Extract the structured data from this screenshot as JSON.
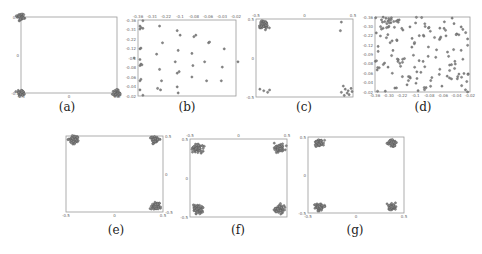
{
  "chart_data": [
    {
      "id": "a",
      "type": "scatter",
      "caption": "(a)",
      "frame": {
        "x": 21,
        "y": 17,
        "w": 96,
        "h": 76
      },
      "xticks": [
        "-0.5",
        "0",
        "0.5"
      ],
      "yticks": [
        "0.5",
        "0",
        "-0.5"
      ],
      "xtick_side": "bottom",
      "ytick_side": "left",
      "xlim": [
        -0.5,
        0.5
      ],
      "ylim": [
        -0.5,
        0.5
      ],
      "clusters": [
        {
          "cx": -0.5,
          "cy": 0.5,
          "n": 40,
          "spread": 0.06
        },
        {
          "cx": -0.5,
          "cy": -0.5,
          "n": 40,
          "spread": 0.06
        },
        {
          "cx": 0.5,
          "cy": -0.5,
          "n": 40,
          "spread": 0.06
        }
      ]
    },
    {
      "id": "b",
      "type": "scatter",
      "caption": "(b)",
      "frame": {
        "x": 138,
        "y": 20,
        "w": 98,
        "h": 76
      },
      "xticks": [
        "-0.36",
        "-0.31",
        "-0.22",
        "-0.1",
        "-0.08",
        "-0.06",
        "-0.03",
        "-0.02"
      ],
      "yticks": [
        "-0.36",
        "-0.31",
        "-0.22",
        "-0.12",
        "-0.1",
        "-0.08",
        "-0.06",
        "-0.04",
        "-0.02"
      ],
      "xtick_side": "top",
      "ytick_side": "left",
      "xlim": [
        0,
        1
      ],
      "ylim": [
        0,
        1
      ],
      "points": [
        [
          0.02,
          0.92
        ],
        [
          0.02,
          0.88
        ],
        [
          0.03,
          0.9
        ],
        [
          0.05,
          0.89
        ],
        [
          0.02,
          0.62
        ],
        [
          0.03,
          0.63
        ],
        [
          0.02,
          0.4
        ],
        [
          0.03,
          0.42
        ],
        [
          0.04,
          0.41
        ],
        [
          0.02,
          0.2
        ],
        [
          0.03,
          0.22
        ],
        [
          0.02,
          0.08
        ],
        [
          0.05,
          0.99
        ],
        [
          0.05,
          0.01
        ],
        [
          -0.04,
          0.5
        ],
        [
          0.02,
          0.48
        ],
        [
          0.22,
          0.92
        ],
        [
          0.25,
          0.7
        ],
        [
          0.19,
          0.55
        ],
        [
          0.22,
          0.35
        ],
        [
          0.24,
          0.2
        ],
        [
          0.2,
          0.1
        ],
        [
          0.23,
          0.08
        ],
        [
          0.4,
          0.86
        ],
        [
          0.43,
          0.8
        ],
        [
          0.41,
          0.6
        ],
        [
          0.38,
          0.45
        ],
        [
          0.4,
          0.3
        ],
        [
          0.42,
          0.32
        ],
        [
          0.4,
          0.12
        ],
        [
          0.41,
          0.04
        ],
        [
          0.57,
          0.78
        ],
        [
          0.59,
          0.8
        ],
        [
          0.55,
          0.56
        ],
        [
          0.56,
          0.4
        ],
        [
          0.55,
          0.25
        ],
        [
          0.72,
          0.7
        ],
        [
          0.73,
          0.71
        ],
        [
          0.68,
          0.45
        ],
        [
          0.7,
          0.2
        ],
        [
          0.88,
          0.62
        ],
        [
          0.86,
          0.38
        ],
        [
          0.85,
          0.2
        ],
        [
          1.02,
          0.45
        ]
      ]
    },
    {
      "id": "c",
      "type": "scatter",
      "caption": "(c)",
      "frame": {
        "x": 256,
        "y": 19,
        "w": 97,
        "h": 78
      },
      "xticks": [
        "-0.5",
        "0",
        "0.5"
      ],
      "yticks": [
        "0.5",
        "0",
        "-0.5"
      ],
      "xtick_side": "top",
      "ytick_side": "left",
      "xlim": [
        -0.5,
        0.5
      ],
      "ylim": [
        -0.5,
        0.5
      ],
      "clusters": [
        {
          "cx": -0.42,
          "cy": 0.42,
          "n": 70,
          "spread": 0.07
        }
      ],
      "points": [
        [
          0.38,
          0.46
        ],
        [
          0.37,
          0.35
        ],
        [
          -0.46,
          -0.4
        ],
        [
          -0.42,
          -0.42
        ],
        [
          -0.38,
          -0.44
        ],
        [
          -0.36,
          -0.41
        ],
        [
          0.4,
          -0.36
        ],
        [
          0.42,
          -0.4
        ],
        [
          0.45,
          -0.42
        ],
        [
          0.48,
          -0.39
        ],
        [
          0.44,
          -0.45
        ],
        [
          0.38,
          -0.44
        ],
        [
          0.46,
          -0.47
        ],
        [
          0.41,
          -0.48
        ],
        [
          0.49,
          -0.43
        ]
      ]
    },
    {
      "id": "d",
      "type": "scatter",
      "caption": "(d)",
      "frame": {
        "x": 375,
        "y": 17,
        "w": 95,
        "h": 75
      },
      "xticks": [
        "-0.36",
        "-0.30",
        "-0.22",
        "-0.1",
        "-0.08",
        "-0.06",
        "-0.04",
        "-0.02"
      ],
      "yticks": [
        "-0.36",
        "-0.30",
        "-0.22",
        "-0.12",
        "-0.09",
        "-0.08",
        "-0.06",
        "-0.04",
        "-0.02"
      ],
      "xtick_side": "bottom",
      "ytick_side": "left",
      "xlim": [
        0,
        1
      ],
      "ylim": [
        0,
        1
      ],
      "random_points": {
        "n": 150,
        "seed": 7,
        "dense_top_left": true
      }
    },
    {
      "id": "e",
      "type": "scatter",
      "caption": "(e)",
      "frame": {
        "x": 66,
        "y": 136,
        "w": 97,
        "h": 76
      },
      "xticks": [
        "-0.5",
        "0",
        "0.5"
      ],
      "yticks": [
        "0.5",
        "0",
        "-0.5"
      ],
      "xtick_side": "bottom",
      "ytick_side": "right",
      "xlim": [
        -0.5,
        0.5
      ],
      "ylim": [
        -0.5,
        0.5
      ],
      "clusters": [
        {
          "cx": -0.42,
          "cy": 0.45,
          "n": 60,
          "spread": 0.07
        },
        {
          "cx": 0.42,
          "cy": 0.45,
          "n": 60,
          "spread": 0.07
        },
        {
          "cx": 0.42,
          "cy": -0.42,
          "n": 60,
          "spread": 0.07
        }
      ]
    },
    {
      "id": "f",
      "type": "scatter",
      "caption": "(f)",
      "frame": {
        "x": 190,
        "y": 139,
        "w": 97,
        "h": 78
      },
      "xticks": [
        "-0.5",
        "0",
        "0.5"
      ],
      "yticks": [
        "0.5",
        "0",
        "-0.5"
      ],
      "xtick_side": "top",
      "ytick_side": "left",
      "xlim": [
        -0.5,
        0.5
      ],
      "ylim": [
        -0.5,
        0.5
      ],
      "clusters": [
        {
          "cx": -0.42,
          "cy": 0.38,
          "n": 60,
          "spread": 0.08
        },
        {
          "cx": 0.42,
          "cy": 0.38,
          "n": 60,
          "spread": 0.08
        },
        {
          "cx": -0.42,
          "cy": -0.4,
          "n": 60,
          "spread": 0.08
        },
        {
          "cx": 0.42,
          "cy": -0.4,
          "n": 60,
          "spread": 0.08
        }
      ]
    },
    {
      "id": "g",
      "type": "scatter",
      "caption": "(g)",
      "frame": {
        "x": 308,
        "y": 137,
        "w": 96,
        "h": 76
      },
      "xticks": [
        "-0.5",
        "0",
        "0.5"
      ],
      "yticks": [
        "0.5",
        "0",
        "-0.5"
      ],
      "xtick_side": "bottom",
      "ytick_side": "left",
      "xlim": [
        -0.5,
        0.5
      ],
      "ylim": [
        -0.5,
        0.5
      ],
      "clusters": [
        {
          "cx": -0.38,
          "cy": 0.42,
          "n": 55,
          "spread": 0.07
        },
        {
          "cx": 0.38,
          "cy": 0.42,
          "n": 55,
          "spread": 0.07
        },
        {
          "cx": -0.38,
          "cy": -0.42,
          "n": 55,
          "spread": 0.07
        },
        {
          "cx": 0.38,
          "cy": -0.42,
          "n": 55,
          "spread": 0.07
        }
      ]
    }
  ],
  "captions": {
    "a": {
      "label": "(a)",
      "x": 67,
      "y": 100
    },
    "b": {
      "label": "(b)",
      "x": 187,
      "y": 100
    },
    "c": {
      "label": "(c)",
      "x": 304,
      "y": 100
    },
    "d": {
      "label": "(d)",
      "x": 423,
      "y": 100
    },
    "e": {
      "label": "(e)",
      "x": 116,
      "y": 223
    },
    "f": {
      "label": "(f)",
      "x": 238,
      "y": 223
    },
    "g": {
      "label": "(g)",
      "x": 355,
      "y": 223
    }
  },
  "style": {
    "marker_color": "#555555",
    "marker_fill": "#8a8a8a",
    "axis_color": "#999999",
    "tick_color": "#666666"
  }
}
